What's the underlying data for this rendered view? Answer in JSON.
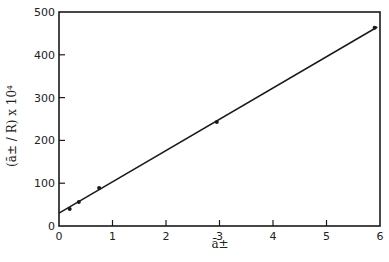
{
  "chart_data": {
    "type": "scatter",
    "title": "",
    "xlabel": "ā±",
    "ylabel": "(ā± / R) x 10⁴",
    "xlim": [
      0,
      6
    ],
    "ylim": [
      0,
      500
    ],
    "xticks": [
      0,
      1,
      2,
      3,
      4,
      5,
      6
    ],
    "yticks": [
      0,
      100,
      200,
      300,
      400,
      500
    ],
    "grid": false,
    "legend": null,
    "series": [
      {
        "name": "data",
        "kind": "points",
        "x": [
          0.2,
          0.37,
          0.75,
          2.95,
          5.9
        ],
        "y": [
          40,
          56,
          89,
          243,
          463
        ]
      },
      {
        "name": "fit",
        "kind": "line",
        "x": [
          0,
          5.95
        ],
        "y": [
          30,
          465
        ]
      }
    ],
    "colors": {
      "ink": "#1a1a1a",
      "background": "#ffffff"
    }
  }
}
